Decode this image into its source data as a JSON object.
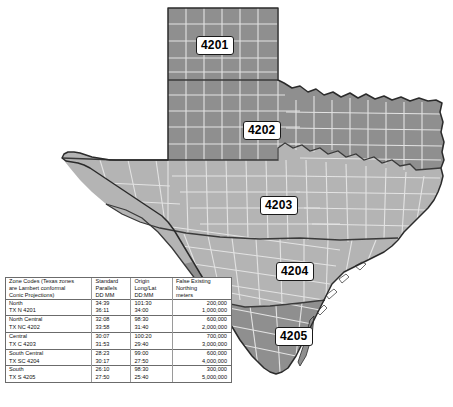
{
  "map": {
    "title": "Texas State Plane Coordinate Zones",
    "zone_labels": [
      {
        "code": "4201",
        "x": 196,
        "y": 36
      },
      {
        "code": "4202",
        "x": 243,
        "y": 121
      },
      {
        "code": "4203",
        "x": 260,
        "y": 196
      },
      {
        "code": "4204",
        "x": 276,
        "y": 262
      },
      {
        "code": "4205",
        "x": 275,
        "y": 327
      }
    ],
    "colors": {
      "zone_dark": "#8f8f8f",
      "zone_light": "#b4b4b4",
      "county_line": "#e2e2e2",
      "zone_border": "#3a3a3a",
      "state_border": "#2b2b2b",
      "background": "#ffffff"
    }
  },
  "legend": {
    "header": {
      "name": "Zone Codes (Texas zones are Lambert conformal Conic Projections)",
      "name_l1": "Zone Codes (Texas zones",
      "name_l2": "are Lambert conformal",
      "name_l3": "Conic Projections)",
      "parallels_l1": "Standard",
      "parallels_l2": "Parallels",
      "parallels_l3": "DD MM",
      "origin_l1": "Origin",
      "origin_l2": "Long/Lat",
      "origin_l3": "DD:MM",
      "northing_l1": "False Existing",
      "northing_l2": "Northing",
      "northing_l3": "meters"
    },
    "rows": [
      {
        "name": "North",
        "parallels": "34:39",
        "origin": "101:30",
        "northing": "200,000"
      },
      {
        "name": "TX N 4201",
        "parallels": "36:11",
        "origin": "34:00",
        "northing": "1,000,000"
      },
      {
        "name": "North Central",
        "parallels": "32:08",
        "origin": "98:30",
        "northing": "600,000"
      },
      {
        "name": "TX NC 4202",
        "parallels": "33:58",
        "origin": "31:40",
        "northing": "2,000,000"
      },
      {
        "name": "Central",
        "parallels": "30:07",
        "origin": "100:20",
        "northing": "700,000"
      },
      {
        "name": "TX C 4203",
        "parallels": "31:53",
        "origin": "29:40",
        "northing": "3,000,000"
      },
      {
        "name": "South Central",
        "parallels": "28:23",
        "origin": "99:00",
        "northing": "600,000"
      },
      {
        "name": "TX SC 4204",
        "parallels": "30:17",
        "origin": "27:50",
        "northing": "4,000,000"
      },
      {
        "name": "South",
        "parallels": "26:10",
        "origin": "98:30",
        "northing": "300,000"
      },
      {
        "name": "TX S 4205",
        "parallels": "27:50",
        "origin": "25:40",
        "northing": "5,000,000"
      }
    ]
  }
}
